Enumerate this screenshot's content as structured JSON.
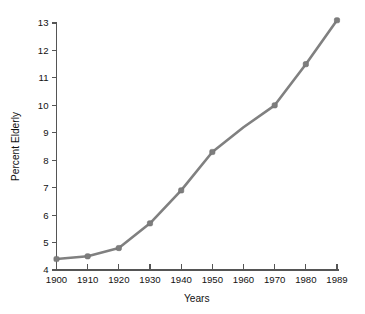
{
  "chart_data": {
    "type": "line",
    "title": "",
    "xlabel": "Years",
    "ylabel": "Percent Elderly",
    "categories": [
      "1900",
      "1910",
      "1920",
      "1930",
      "1940",
      "1950",
      "1960",
      "1970",
      "1980",
      "1989"
    ],
    "x": [
      1900,
      1910,
      1920,
      1930,
      1940,
      1950,
      1960,
      1970,
      1980,
      1989
    ],
    "values": [
      4.4,
      4.5,
      4.8,
      5.7,
      6.9,
      8.3,
      9.2,
      10.0,
      11.5,
      13.1
    ],
    "series": [
      {
        "name": "Percent Elderly",
        "values": [
          4.4,
          4.5,
          4.8,
          5.7,
          6.9,
          8.3,
          9.2,
          10.0,
          11.5,
          13.1
        ]
      }
    ],
    "markers_shown_at": [
      1900,
      1910,
      1920,
      1930,
      1940,
      1950,
      1970,
      1980,
      1989
    ],
    "xlim": [
      1900,
      1989
    ],
    "ylim": [
      4,
      13
    ],
    "ytick_labels": [
      "4",
      "5",
      "6",
      "7",
      "8",
      "9",
      "10",
      "11",
      "12",
      "13"
    ],
    "ytick_values": [
      4,
      5,
      6,
      7,
      8,
      9,
      10,
      11,
      12,
      13
    ],
    "xtick_labels": [
      "1900",
      "1910",
      "1920",
      "1930",
      "1940",
      "1950",
      "1960",
      "1970",
      "1980",
      "1989"
    ],
    "grid": false,
    "legend": false,
    "legend_position": "none",
    "line_color": "#808080",
    "marker_color": "#7d7d7d",
    "axis_color": "#555555",
    "background_color": "#ffffff"
  }
}
